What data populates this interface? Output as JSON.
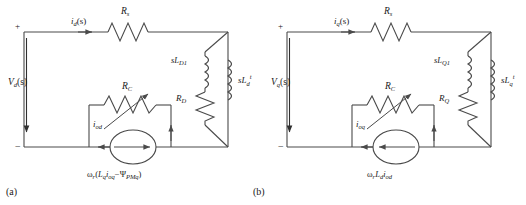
{
  "figure": {
    "type": "circuit-diagram",
    "width": 526,
    "height": 205,
    "background": "#ffffff",
    "line_color": "#4a4a4a",
    "text_color": "#1a1a1a"
  },
  "panels": [
    {
      "tag": "(a)",
      "axis": "d-axis",
      "terminal_plus": "+",
      "terminal_minus": "−",
      "source_voltage": {
        "base": "V",
        "sub": "d",
        "suffix": "(s)"
      },
      "input_current": {
        "base": "i",
        "sub": "d",
        "suffix": "(s)"
      },
      "series_resistor": {
        "base": "R",
        "sub": "s"
      },
      "variable_resistor": {
        "base": "R",
        "sub": "C"
      },
      "branch_current": {
        "base": "i",
        "sub": "od"
      },
      "damper_inductor": {
        "base": "sL",
        "sub": "D1"
      },
      "damper_resistor": {
        "base": "R",
        "sub": "D"
      },
      "transient_inductor": {
        "base": "sL",
        "sub": "d",
        "sup": "t"
      },
      "dependent_source": {
        "text": "ωr(Lq ioq − ΨPMq)",
        "omega": "ω",
        "omega_sub": "r",
        "open": "(",
        "term1_base": "L",
        "term1_sub": "q",
        "term2_base": "i",
        "term2_sub": "oq",
        "minus": "−",
        "psi": "Ψ",
        "psi_sub": "PMq",
        "close": ")"
      }
    },
    {
      "tag": "(b)",
      "axis": "q-axis",
      "terminal_plus": "+",
      "terminal_minus": "−",
      "source_voltage": {
        "base": "V",
        "sub": "q",
        "suffix": "(s)"
      },
      "input_current": {
        "base": "i",
        "sub": "q",
        "suffix": "(s)"
      },
      "series_resistor": {
        "base": "R",
        "sub": "s"
      },
      "variable_resistor": {
        "base": "R",
        "sub": "C"
      },
      "branch_current": {
        "base": "i",
        "sub": "oq"
      },
      "damper_inductor": {
        "base": "sL",
        "sub": "Q1"
      },
      "damper_resistor": {
        "base": "R",
        "sub": "Q"
      },
      "transient_inductor": {
        "base": "sL",
        "sub": "q",
        "sup": "t"
      },
      "dependent_source": {
        "text": "ωr Ld iod",
        "omega": "ω",
        "omega_sub": "r",
        "term1_base": "L",
        "term1_sub": "d",
        "term2_base": "i",
        "term2_sub": "od"
      }
    }
  ]
}
